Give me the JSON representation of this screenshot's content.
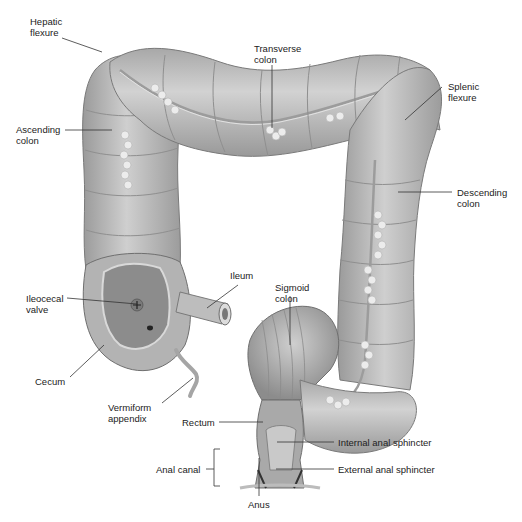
{
  "diagram": {
    "colors": {
      "tissue": "#b8b8b8",
      "tissue_light": "#d9d9d9",
      "tissue_dark": "#8a8a8a",
      "fat": "#ececec",
      "text": "#222222",
      "leader": "#333333",
      "background": "#ffffff"
    },
    "labels": {
      "hepatic_flexure": "Hepatic\nflexure",
      "transverse_colon": "Transverse\ncolon",
      "splenic_flexure": "Splenic\nflexure",
      "ascending_colon": "Ascending\ncolon",
      "descending_colon": "Descending\ncolon",
      "ileocecal_valve": "Ileocecal\nvalve",
      "ileum": "Ileum",
      "sigmoid_colon": "Sigmoid\ncolon",
      "cecum": "Cecum",
      "vermiform_appendix": "Vermiform\nappendix",
      "rectum": "Rectum",
      "internal_anal_sphincter": "Internal anal sphincter",
      "anal_canal": "Anal canal",
      "external_anal_sphincter": "External anal sphincter",
      "anus": "Anus"
    }
  }
}
